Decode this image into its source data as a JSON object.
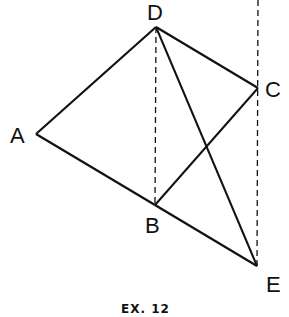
{
  "figure": {
    "caption": "EX. 12",
    "points": {
      "A": {
        "label": "A",
        "x": 36,
        "y": 134
      },
      "B": {
        "label": "B",
        "x": 155,
        "y": 205
      },
      "C": {
        "label": "C",
        "x": 258,
        "y": 88
      },
      "D": {
        "label": "D",
        "x": 156,
        "y": 27
      },
      "E": {
        "label": "E",
        "x": 257,
        "y": 266
      }
    },
    "solid_segments": [
      "AD",
      "DC",
      "AB",
      "BE",
      "BC",
      "DE"
    ],
    "dashed_segments": [
      "D-B vertical",
      "C-E vertical extended to top"
    ],
    "line_color": "#111111"
  }
}
